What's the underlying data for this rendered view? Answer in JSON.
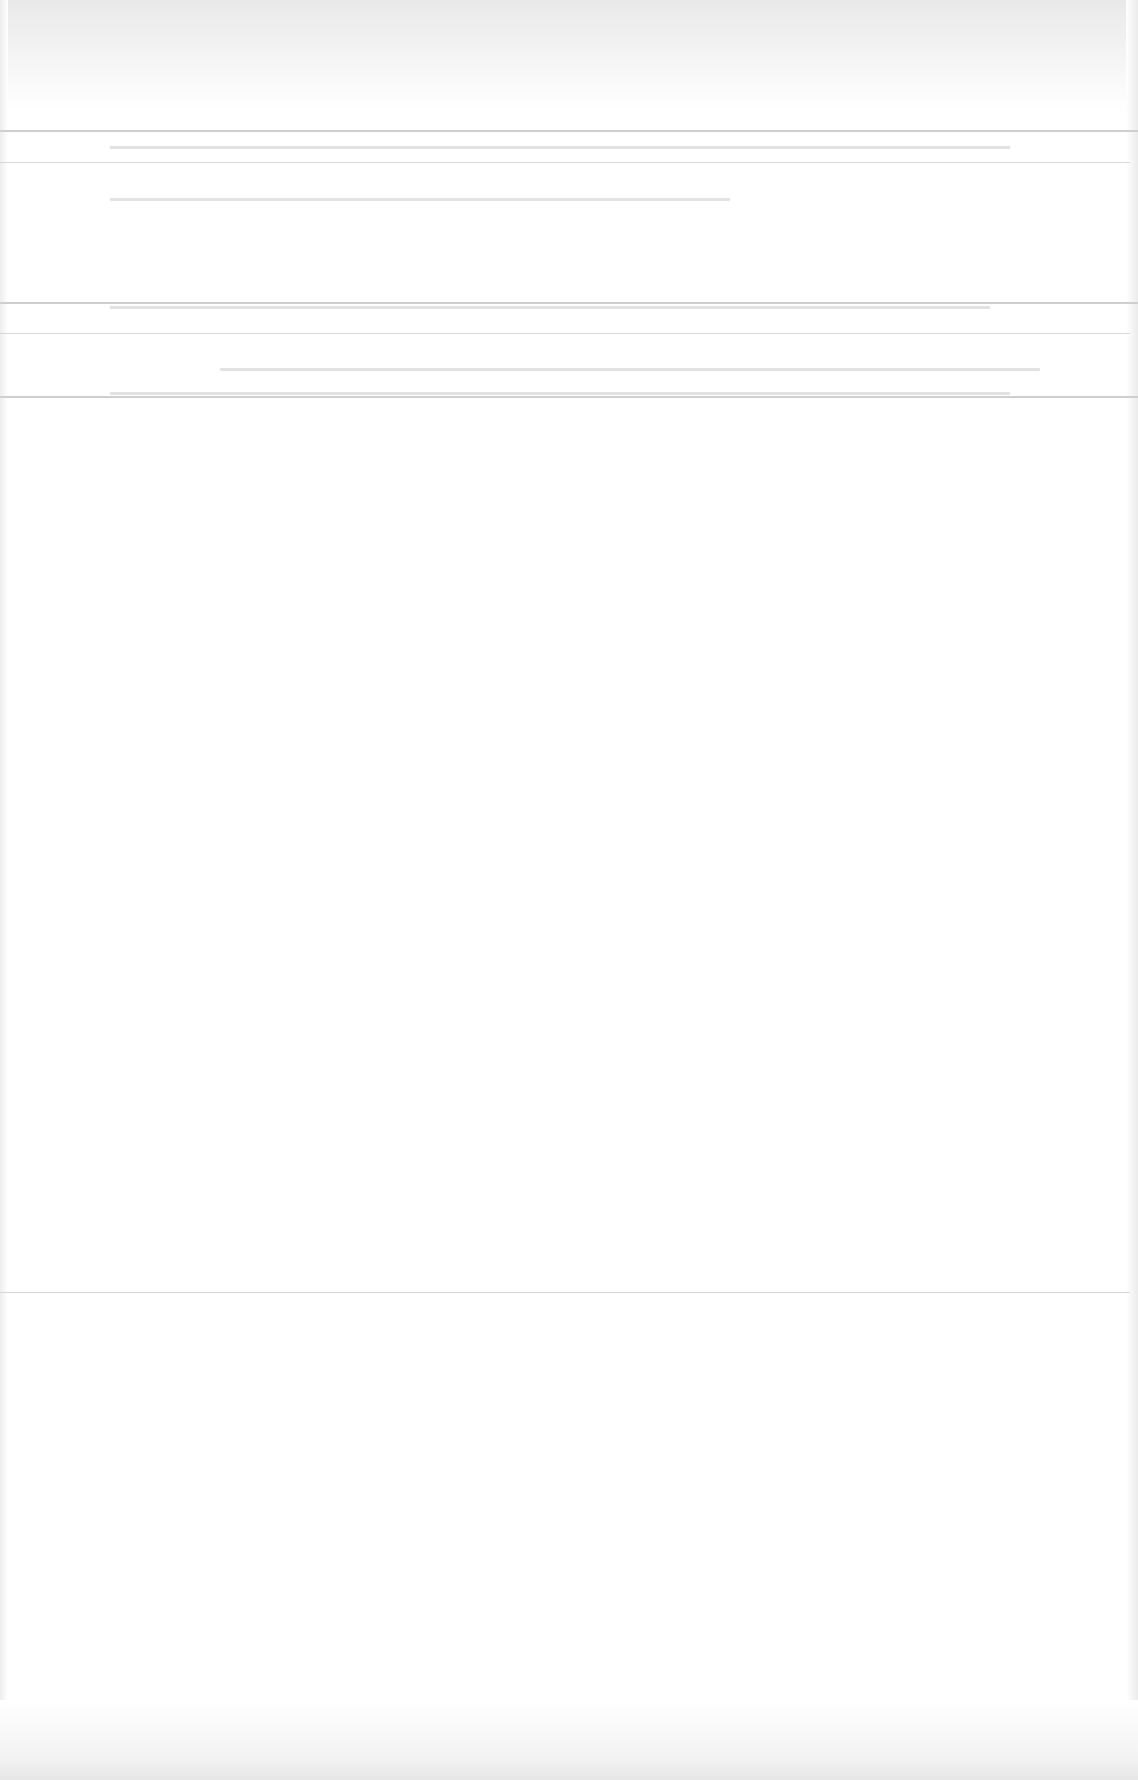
{
  "page": {
    "background": "#ffffff",
    "rule_color": "#cfcfcf",
    "legibility": "washed-out"
  },
  "header_band": {
    "lines": [
      "",
      ""
    ]
  },
  "section_one": {
    "lines": [
      "",
      ""
    ]
  },
  "section_two": {
    "lines": [
      "",
      ""
    ]
  },
  "body_area": {
    "content": ""
  }
}
